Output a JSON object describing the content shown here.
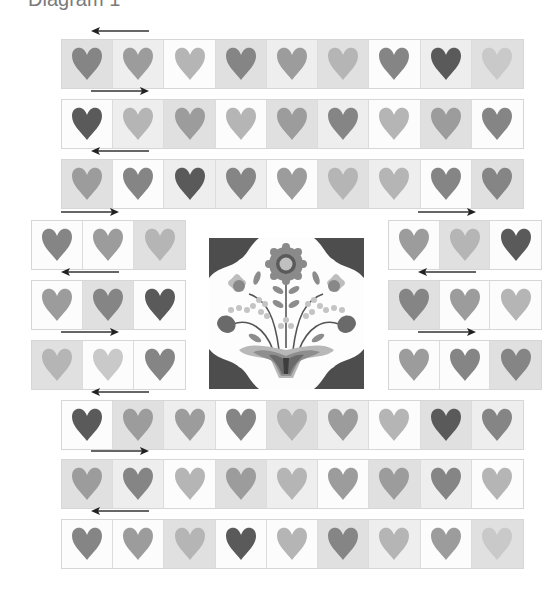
{
  "caption": "Diagram 1",
  "diagram": {
    "colors": {
      "heart_dark": "#5a5a5a",
      "heart_medium": "#858585",
      "heart_mid_light": "#9c9c9c",
      "heart_light": "#b5b5b5",
      "heart_pale": "#c9c9c9",
      "bg_white": "#fcfcfc",
      "bg_light": "#eeeeee",
      "bg_gray": "#e0e0e0",
      "flower_corner": "#4d4d4d"
    },
    "top_rows": [
      {
        "arrow": "left",
        "blocks": [
          [
            "bg_gray",
            "heart_medium"
          ],
          [
            "bg_light",
            "heart_mid_light"
          ],
          [
            "bg_white",
            "heart_light"
          ],
          [
            "bg_gray",
            "heart_medium"
          ],
          [
            "bg_light",
            "heart_mid_light"
          ],
          [
            "bg_gray",
            "heart_light"
          ],
          [
            "bg_white",
            "heart_medium"
          ],
          [
            "bg_light",
            "heart_dark"
          ],
          [
            "bg_gray",
            "heart_pale"
          ]
        ]
      },
      {
        "arrow": "right",
        "blocks": [
          [
            "bg_white",
            "heart_dark"
          ],
          [
            "bg_light",
            "heart_light"
          ],
          [
            "bg_gray",
            "heart_mid_light"
          ],
          [
            "bg_white",
            "heart_light"
          ],
          [
            "bg_gray",
            "heart_mid_light"
          ],
          [
            "bg_light",
            "heart_medium"
          ],
          [
            "bg_white",
            "heart_light"
          ],
          [
            "bg_gray",
            "heart_mid_light"
          ],
          [
            "bg_white",
            "heart_medium"
          ]
        ]
      },
      {
        "arrow": "left",
        "blocks": [
          [
            "bg_gray",
            "heart_mid_light"
          ],
          [
            "bg_white",
            "heart_medium"
          ],
          [
            "bg_light",
            "heart_dark"
          ],
          [
            "bg_light",
            "heart_medium"
          ],
          [
            "bg_white",
            "heart_mid_light"
          ],
          [
            "bg_gray",
            "heart_light"
          ],
          [
            "bg_light",
            "heart_light"
          ],
          [
            "bg_white",
            "heart_medium"
          ],
          [
            "bg_gray",
            "heart_medium"
          ]
        ]
      }
    ],
    "left_rows": [
      {
        "arrow": "right",
        "blocks": [
          [
            "bg_white",
            "heart_medium"
          ],
          [
            "bg_white",
            "heart_mid_light"
          ],
          [
            "bg_gray",
            "heart_light"
          ]
        ]
      },
      {
        "arrow": "left",
        "blocks": [
          [
            "bg_white",
            "heart_mid_light"
          ],
          [
            "bg_gray",
            "heart_medium"
          ],
          [
            "bg_white",
            "heart_dark"
          ]
        ]
      },
      {
        "arrow": "right",
        "blocks": [
          [
            "bg_gray",
            "heart_light"
          ],
          [
            "bg_white",
            "heart_pale"
          ],
          [
            "bg_white",
            "heart_medium"
          ]
        ]
      }
    ],
    "right_rows": [
      {
        "arrow": "right",
        "blocks": [
          [
            "bg_white",
            "heart_mid_light"
          ],
          [
            "bg_gray",
            "heart_light"
          ],
          [
            "bg_white",
            "heart_dark"
          ]
        ]
      },
      {
        "arrow": "left",
        "blocks": [
          [
            "bg_gray",
            "heart_medium"
          ],
          [
            "bg_white",
            "heart_mid_light"
          ],
          [
            "bg_white",
            "heart_light"
          ]
        ]
      },
      {
        "arrow": "right",
        "blocks": [
          [
            "bg_white",
            "heart_mid_light"
          ],
          [
            "bg_white",
            "heart_medium"
          ],
          [
            "bg_gray",
            "heart_medium"
          ]
        ]
      }
    ],
    "bottom_rows": [
      {
        "arrow": "left",
        "blocks": [
          [
            "bg_white",
            "heart_dark"
          ],
          [
            "bg_gray",
            "heart_mid_light"
          ],
          [
            "bg_light",
            "heart_mid_light"
          ],
          [
            "bg_white",
            "heart_medium"
          ],
          [
            "bg_gray",
            "heart_light"
          ],
          [
            "bg_light",
            "heart_mid_light"
          ],
          [
            "bg_white",
            "heart_light"
          ],
          [
            "bg_gray",
            "heart_dark"
          ],
          [
            "bg_light",
            "heart_medium"
          ]
        ]
      },
      {
        "arrow": "right",
        "blocks": [
          [
            "bg_gray",
            "heart_mid_light"
          ],
          [
            "bg_light",
            "heart_medium"
          ],
          [
            "bg_white",
            "heart_light"
          ],
          [
            "bg_gray",
            "heart_mid_light"
          ],
          [
            "bg_light",
            "heart_light"
          ],
          [
            "bg_white",
            "heart_mid_light"
          ],
          [
            "bg_gray",
            "heart_mid_light"
          ],
          [
            "bg_light",
            "heart_medium"
          ],
          [
            "bg_white",
            "heart_light"
          ]
        ]
      },
      {
        "arrow": "left",
        "blocks": [
          [
            "bg_white",
            "heart_medium"
          ],
          [
            "bg_white",
            "heart_mid_light"
          ],
          [
            "bg_gray",
            "heart_light"
          ],
          [
            "bg_white",
            "heart_dark"
          ],
          [
            "bg_white",
            "heart_light"
          ],
          [
            "bg_gray",
            "heart_medium"
          ],
          [
            "bg_light",
            "heart_light"
          ],
          [
            "bg_white",
            "heart_mid_light"
          ],
          [
            "bg_gray",
            "heart_pale"
          ]
        ]
      }
    ],
    "center_block": {
      "name": "flower appliqué block"
    }
  }
}
